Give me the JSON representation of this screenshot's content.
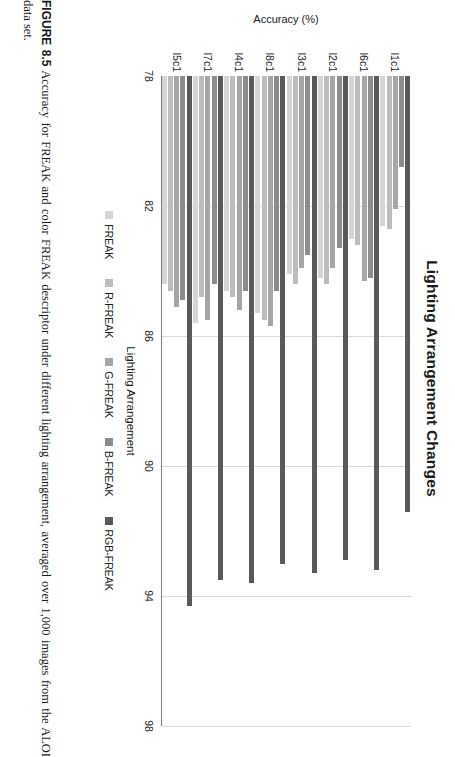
{
  "chart_data": {
    "type": "bar",
    "orientation": "horizontal",
    "title": "Lighting Arrangement Changes",
    "xlabel": "Lighting Arrangement",
    "ylabel": "Accuracy (%)",
    "categories": [
      "l1c1",
      "l6c1",
      "l2c1",
      "l3c1",
      "l8c1",
      "l4c1",
      "l7c1",
      "l5c1"
    ],
    "ylim": [
      78,
      98
    ],
    "yticks": [
      78,
      82,
      86,
      90,
      94,
      98
    ],
    "grid": true,
    "legend_position": "bottom",
    "series": [
      {
        "name": "FREAK",
        "color": "#d5d5d5",
        "values": [
          82.6,
          83.0,
          84.2,
          84.1,
          85.3,
          84.6,
          85.6,
          84.4
        ]
      },
      {
        "name": "R-FREAK",
        "color": "#bdbdbd",
        "values": [
          82.7,
          83.2,
          84.4,
          84.4,
          85.5,
          84.8,
          84.8,
          84.6
        ]
      },
      {
        "name": "G-FREAK",
        "color": "#a6a6a6",
        "values": [
          82.1,
          84.3,
          83.9,
          83.9,
          85.7,
          85.2,
          85.5,
          85.1
        ]
      },
      {
        "name": "B-FREAK",
        "color": "#8c8c8c",
        "values": [
          80.8,
          84.2,
          83.3,
          83.5,
          84.6,
          84.6,
          84.4,
          84.9
        ]
      },
      {
        "name": "RGB-FREAK",
        "color": "#595959",
        "values": [
          91.4,
          93.2,
          92.9,
          93.3,
          93.0,
          93.6,
          93.5,
          94.3
        ]
      }
    ]
  },
  "caption": {
    "figure_label": "FIGURE 8.5",
    "text": "Accuracy for FREAK and color FREAK descriptor under different lighting arrangement, averaged over 1,000 images from the ALOI data set."
  }
}
